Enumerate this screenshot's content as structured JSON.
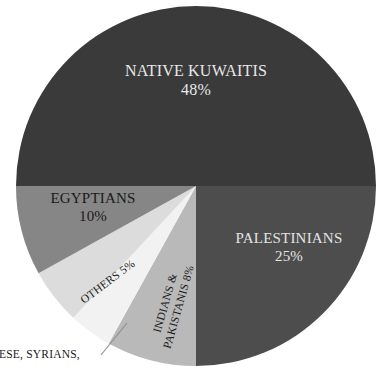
{
  "chart_data": {
    "type": "pie",
    "title": "",
    "subtitle": "",
    "xlabel": "",
    "ylabel": "",
    "legend_position": "none",
    "grid": false,
    "categories": [
      "NATIVE KUWAITIS",
      "PALESTINIANS",
      "EGYPTIANS",
      "INDIANS & PAKISTANIS",
      "OTHERS"
    ],
    "values": [
      48,
      25,
      10,
      8,
      5
    ],
    "units": "percent",
    "slices": [
      {
        "name": "NATIVE KUWAITIS",
        "label": "NATIVE KUWAITIS",
        "percent_text": "48%",
        "value": 48,
        "color": "#3a3a3a",
        "start_angle_deg": 180,
        "end_angle_deg": 360,
        "label_placement": "inside"
      },
      {
        "name": "PALESTINIANS",
        "label": "PALESTINIANS",
        "percent_text": "25%",
        "value": 25,
        "color": "#4d4d4d",
        "start_angle_deg": 0,
        "end_angle_deg": 90,
        "label_placement": "inside"
      },
      {
        "name": "INDIANS & PAKISTANIS",
        "label_line1": "INDIANS &",
        "label_line2": "PAKISTANIS 8%",
        "percent_text": "8%",
        "value": 8,
        "color": "#b9b9b9",
        "start_angle_deg": 90,
        "end_angle_deg": 119,
        "label_placement": "inside-rotated"
      },
      {
        "name": "LEBANESE, SYRIANS",
        "label": "",
        "percent_text": "",
        "value": 4,
        "color": "#f2f2f2",
        "start_angle_deg": 119,
        "end_angle_deg": 133,
        "label_placement": "callout"
      },
      {
        "name": "OTHERS",
        "label": "OTHERS 5%",
        "percent_text": "5%",
        "value": 5,
        "color": "#dcdcdc",
        "start_angle_deg": 133,
        "end_angle_deg": 151,
        "label_placement": "inside-rotated"
      },
      {
        "name": "EGYPTIANS",
        "label": "EGYPTIANS",
        "percent_text": "10%",
        "value": 10,
        "color": "#868686",
        "start_angle_deg": 151,
        "end_angle_deg": 180,
        "label_placement": "inside"
      }
    ],
    "callout": {
      "text": "ANESE, SYRIANS,",
      "note": "text clipped at left edge of image",
      "leader_line": true
    },
    "geometry": {
      "center_x": 196,
      "center_y": 186,
      "radius": 180
    },
    "colors": {
      "native_kuwaitis": "#3a3a3a",
      "palestinians": "#4d4d4d",
      "egyptians": "#868686",
      "indians_pakistanis": "#b9b9b9",
      "others": "#dcdcdc",
      "lebanese_syrians": "#f2f2f2",
      "background": "#ffffff",
      "dark_text": "#1a1a1a",
      "light_text": "#e8e8e8"
    }
  }
}
